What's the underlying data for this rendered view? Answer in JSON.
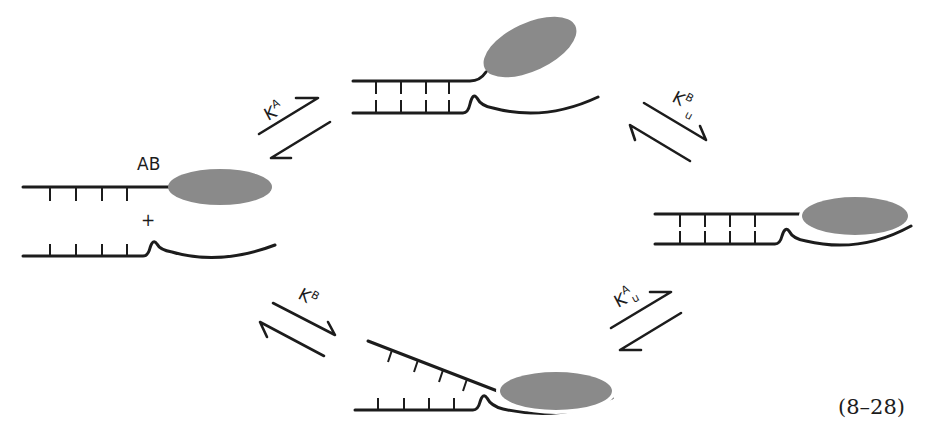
{
  "diagram": {
    "title": "",
    "equation_number": "(8–28)",
    "colors": {
      "strand": "#1c1c1c",
      "protein": "#8a8a8a",
      "background": "#ffffff"
    },
    "states": [
      {
        "id": "free",
        "label": "AB",
        "separator": "+",
        "description": "Protein AB free, DNA strand with hairpin unbound"
      },
      {
        "id": "A-bound",
        "label": "",
        "description": "Domain A bound, domain B tilted away"
      },
      {
        "id": "AB-bound",
        "label": "",
        "description": "Both domains bound to DNA"
      },
      {
        "id": "B-bound",
        "label": "",
        "description": "Domain B bound, domain A strand lifted"
      }
    ],
    "equilibria": [
      {
        "id": "free-to-A",
        "constant": "K",
        "superscript": "A",
        "subscript": ""
      },
      {
        "id": "A-to-AB",
        "constant": "K",
        "superscript": "B",
        "subscript": "u"
      },
      {
        "id": "free-to-B",
        "constant": "K",
        "superscript": "B",
        "subscript": ""
      },
      {
        "id": "B-to-AB",
        "constant": "K",
        "superscript": "A",
        "subscript": "u"
      }
    ]
  }
}
